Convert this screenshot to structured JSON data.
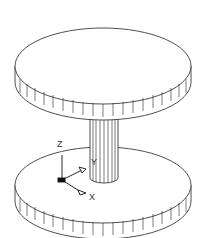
{
  "diagram": {
    "stroke_color": "#222222",
    "background": "#ffffff",
    "axes": {
      "z_label": "Z",
      "y_label": "Y",
      "x_label": "X"
    }
  }
}
